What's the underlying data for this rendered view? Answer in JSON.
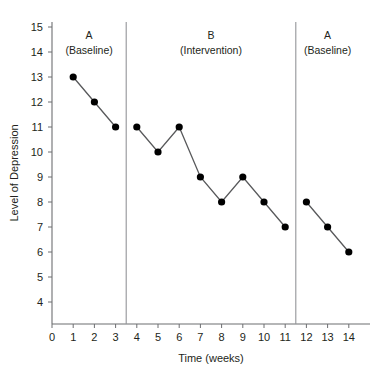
{
  "chart_data": {
    "type": "line",
    "title": "",
    "xlabel": "Time (weeks)",
    "ylabel": "Level of Depression",
    "xlim": [
      0,
      15
    ],
    "ylim": [
      3.4,
      15.6
    ],
    "grid": false,
    "legend": "none",
    "x_ticks": [
      0,
      1,
      2,
      3,
      4,
      5,
      6,
      7,
      8,
      9,
      10,
      11,
      12,
      13,
      14
    ],
    "y_ticks": [
      4,
      5,
      6,
      7,
      8,
      9,
      10,
      11,
      12,
      13,
      14,
      15
    ],
    "marker": "filled-circle",
    "line_color": "#58595b",
    "marker_color": "#000000",
    "phases": [
      {
        "id": "phase-a1",
        "letter": "A",
        "condition": "(Baseline)",
        "x_start": 0,
        "x_end": 3.5,
        "label_x": 1.75,
        "x": [
          1,
          2,
          3
        ],
        "y": [
          13,
          12,
          11
        ]
      },
      {
        "id": "phase-b",
        "letter": "B",
        "condition": "(Intervention)",
        "x_start": 3.5,
        "x_end": 11.5,
        "label_x": 7.5,
        "x": [
          4,
          5,
          6,
          7,
          8,
          9,
          10,
          11
        ],
        "y": [
          11,
          10,
          11,
          9,
          8,
          9,
          8,
          7
        ]
      },
      {
        "id": "phase-a2",
        "letter": "A",
        "condition": "(Baseline)",
        "x_start": 11.5,
        "x_end": 15,
        "label_x": 13,
        "x": [
          12,
          13,
          14
        ],
        "y": [
          8,
          7,
          6
        ]
      }
    ],
    "phase_dividers": [
      3.5,
      11.5
    ],
    "series": [
      {
        "name": "Level of Depression",
        "x": [
          1,
          2,
          3,
          4,
          5,
          6,
          7,
          8,
          9,
          10,
          11,
          12,
          13,
          14
        ],
        "values": [
          13,
          12,
          11,
          11,
          10,
          11,
          9,
          8,
          9,
          8,
          7,
          8,
          7,
          6
        ]
      }
    ]
  }
}
